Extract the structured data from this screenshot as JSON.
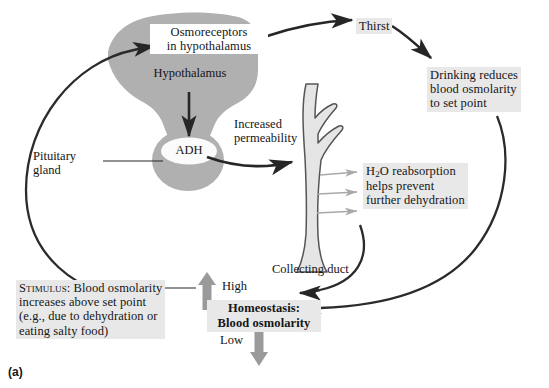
{
  "figure": {
    "panel_label": "(a)",
    "title_hidden": "",
    "colors": {
      "organ_fill": "#b0b0b0",
      "duct_fill": "#e2e2e2",
      "duct_stroke": "#4a4a4a",
      "label_bg": "#e8e8e8",
      "arrow_dark": "#262626",
      "arrow_grey": "#9a9a9a",
      "thin_arrow_grey": "#a9a9a9",
      "text": "#151515",
      "background": "#ffffff"
    }
  },
  "nodes": {
    "osmoreceptors": "Osmoreceptors\nin hypothalamus",
    "hypothalamus": "Hypothalamus",
    "adh": "ADH",
    "pituitary_gland": "Pituitary\ngland",
    "increased_permeability": "Increased\npermeability",
    "thirst": "Thirst",
    "drinking": "Drinking reduces\nblood osmolarity\nto set point",
    "water_reabsorption": "reabsorption\nhelps prevent\nfurther dehydration",
    "water_reabsorption_prefix": "H",
    "water_reabsorption_sub": "2",
    "water_reabsorption_suffix": "O",
    "collecting_duct": "Collecting duct",
    "stimulus_label": "Stimulus:",
    "stimulus_text": " Blood osmolarity\nincreases above set point\n(e.g., due to dehydration or\neating salty food)",
    "homeostasis_line1": "Homeostasis:",
    "homeostasis_line2": "Blood osmolarity",
    "high_label": "High",
    "low_label": "Low"
  },
  "icons": {
    "hypothalamus_shape": "hypothalamus-organ-icon",
    "pituitary_shape": "pituitary-gland-icon",
    "adh_vesicle": "adh-vesicle-icon",
    "collecting_duct_shape": "collecting-duct-icon",
    "up_arrow": "up-arrow-icon",
    "down_arrow": "down-arrow-icon"
  }
}
